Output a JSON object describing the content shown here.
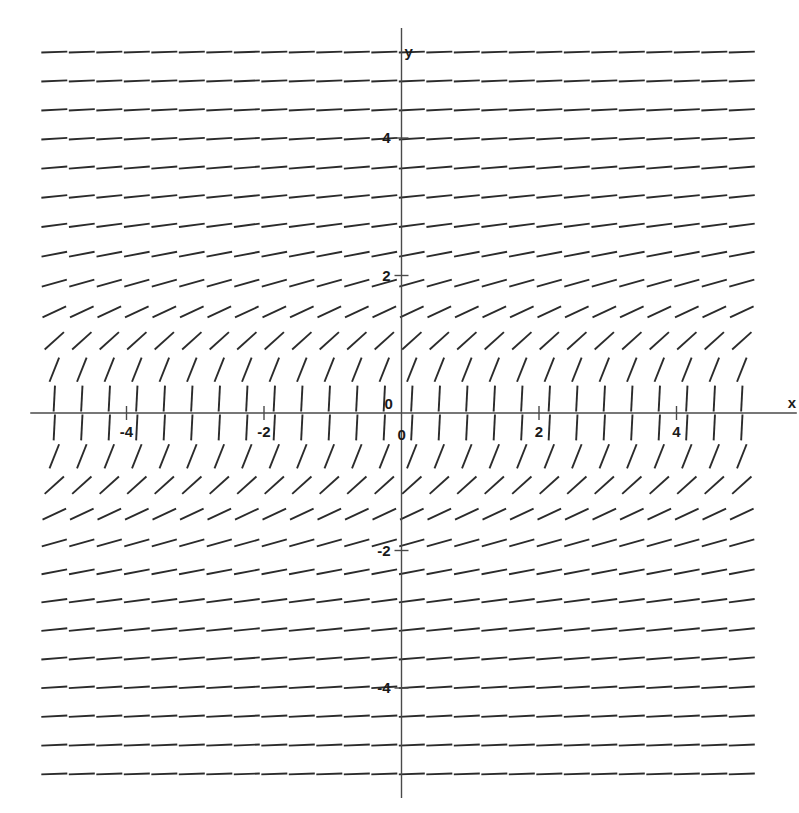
{
  "figure": {
    "kind": "slope-field",
    "background_color": "#ffffff",
    "ink_color": "#2b2b2b",
    "axis_color": "#4a4a4a"
  },
  "axes": {
    "x_axis_label": "x",
    "y_axis_label": "y",
    "origin_label_upper": "0",
    "origin_label_lower": "0",
    "x_ticks": [
      {
        "value": -4,
        "label": "4"
      },
      {
        "value": -2,
        "label": "2"
      },
      {
        "value": 2,
        "label": "2"
      },
      {
        "value": 4,
        "label": "4"
      }
    ],
    "y_ticks": [
      {
        "value": 4,
        "label": "4"
      },
      {
        "value": 2,
        "label": "2"
      },
      {
        "value": -2,
        "label": "-2"
      },
      {
        "value": -4,
        "label": "-4"
      }
    ],
    "x_tick_label_prefix_negative": "-",
    "xlim": [
      -5.4,
      5.75
    ],
    "ylim": [
      -5.6,
      5.6
    ]
  },
  "chart_data": {
    "type": "line",
    "title": "",
    "xlabel": "x",
    "ylabel": "y",
    "grid": false,
    "legend": null,
    "xlim": [
      -5.4,
      5.75
    ],
    "ylim": [
      -5.6,
      5.6
    ],
    "xticks": [
      -4,
      -2,
      0,
      2,
      4
    ],
    "xticklabels": [
      "-4",
      "-2",
      "0",
      "2",
      "4"
    ],
    "yticks": [
      -4,
      -2,
      2,
      4
    ],
    "yticklabels": [
      "-4",
      "-2",
      "2",
      "4"
    ],
    "slope_rule": "dy/dx = 1 / y^2",
    "grid_columns": 26,
    "grid_rows": 26,
    "grid_x_start": -5.05,
    "grid_x_step": 0.4,
    "grid_y_start": -5.25,
    "grid_y_step": 0.42,
    "segment_length_px": 26,
    "series": [
      {
        "name": "slope segments",
        "values": []
      }
    ]
  }
}
